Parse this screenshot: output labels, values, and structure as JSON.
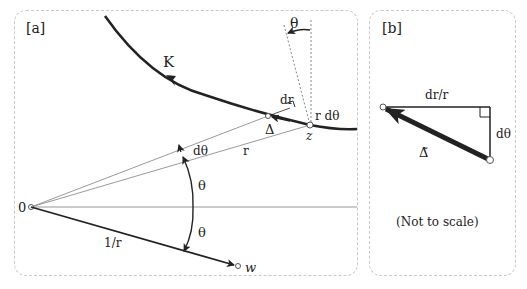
{
  "panel_a": {
    "tag": "[a]",
    "curve_label": "K",
    "theta_top": "θ",
    "dr": "dr",
    "r_dtheta": "r dθ",
    "delta": "Δ",
    "z": "z",
    "dtheta": "dθ",
    "r": "r",
    "theta_upper": "θ",
    "theta_lower": "θ",
    "origin": "0",
    "inv_r": "1/r",
    "w": "w"
  },
  "panel_b": {
    "tag": "[b]",
    "dr_over_r": "dr/r",
    "dtheta": "dθ",
    "delta_tilde": "Δ̃",
    "note": "(Not to scale)"
  },
  "colors": {
    "ink": "#222222",
    "thin": "#888888",
    "border": "#c8c8c8"
  }
}
